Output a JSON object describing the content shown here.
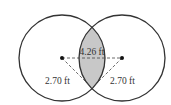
{
  "diagram": {
    "type": "overlapping-circles",
    "circles": [
      {
        "name": "left-circle",
        "cx": 62,
        "cy": 58,
        "r": 43
      },
      {
        "name": "right-circle",
        "cx": 122,
        "cy": 58,
        "r": 43
      }
    ],
    "labels": {
      "center_distance": "4.26 ft",
      "left_radius": "2.70 ft",
      "right_radius": "2.70 ft"
    },
    "colors": {
      "stroke": "#333333",
      "overlap_fill": "#c8c8c8",
      "background": "#ffffff"
    }
  }
}
